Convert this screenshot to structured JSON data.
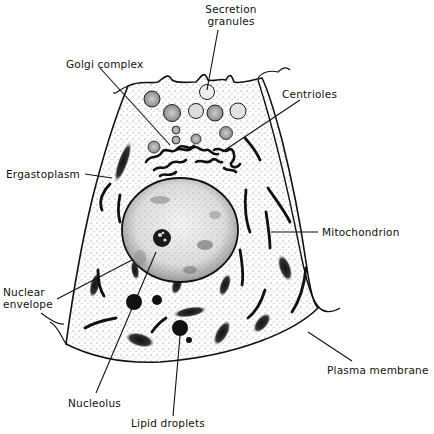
{
  "figure": {
    "labels": {
      "secretion_granules": "Secretion\ngranules",
      "golgi_complex": "Golgi complex",
      "centrioles": "Centrioles",
      "ergastoplasm": "Ergastoplasm",
      "mitochondrion": "Mitochondrion",
      "nuclear_envelope": "Nuclear\nenvelope",
      "nucleolus": "Nucleolus",
      "lipid_droplets": "Lipid droplets",
      "plasma_membrane": "Plasma membrane"
    },
    "colors": {
      "ink": "#111111",
      "stipple": "#555555",
      "background": "#ffffff"
    }
  }
}
